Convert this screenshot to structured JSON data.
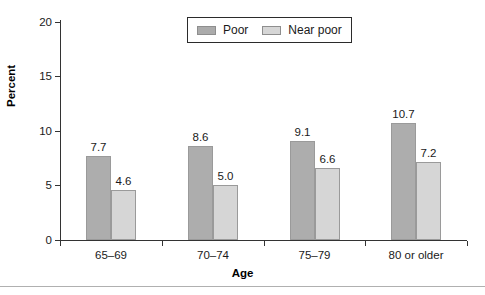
{
  "chart_data": {
    "type": "bar",
    "title": "",
    "xlabel": "Age",
    "ylabel": "Percent",
    "ylim": [
      0,
      20
    ],
    "yticks": [
      0,
      5,
      10,
      15,
      20
    ],
    "ytick_labels": [
      "0",
      "5",
      "10",
      "15",
      "20"
    ],
    "grid": false,
    "legend_position": "top-center",
    "categories": [
      "65–69",
      "70–74",
      "75–79",
      "80 or older"
    ],
    "series": [
      {
        "name": "Poor",
        "color": "#adadad",
        "values": [
          7.7,
          8.6,
          9.1,
          10.7
        ],
        "value_labels": [
          "7.7",
          "8.6",
          "9.1",
          "10.7"
        ]
      },
      {
        "name": "Near poor",
        "color": "#d6d6d6",
        "values": [
          4.6,
          5.0,
          6.6,
          7.2
        ],
        "value_labels": [
          "4.6",
          "5.0",
          "6.6",
          "7.2"
        ]
      }
    ]
  },
  "legend": {
    "entries": [
      {
        "label": "Poor",
        "swatch": "poor"
      },
      {
        "label": "Near poor",
        "swatch": "near"
      }
    ]
  },
  "axes": {
    "y_title": "Percent",
    "x_title": "Age"
  },
  "colors": {
    "poor": "#adadad",
    "near_poor": "#d6d6d6",
    "axis": "#333333",
    "text": "#1a1a1a",
    "rule": "#b0b0b0"
  }
}
